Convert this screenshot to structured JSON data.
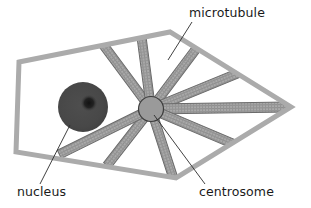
{
  "diagram": {
    "labels": {
      "microtubule": "microtubule",
      "nucleus": "nucleus",
      "centrosome": "centrosome"
    },
    "colors": {
      "background": "#ffffff",
      "membrane_fill": "#a8a8a8",
      "membrane_stroke": "#6e6e6e",
      "cytoplasm": "#ffffff",
      "nucleus_fill": "#4a4a4a",
      "nucleolus_fill": "#1d1d1d",
      "centrosome_fill": "#9a9a9a",
      "centrosome_stroke": "#3c3c3c",
      "microtubule_fill": "#a5a5a5",
      "microtubule_stroke": "#6b6b6b",
      "leader_line": "#2b2b2b",
      "text": "#1a1a1a"
    },
    "shapes": {
      "cell_outline_points": "19,62 170,32 291,107 176,178 16,152",
      "membrane_thickness": 5,
      "nucleus": {
        "cx": 83,
        "cy": 107,
        "r": 25
      },
      "nucleolus": {
        "cx": 89,
        "cy": 103,
        "r": 4
      },
      "centrosome": {
        "cx": 151,
        "cy": 109,
        "r": 12.5
      }
    },
    "microtubules": [
      {
        "name": "microtubule-up-left",
        "x2": 99,
        "y2": 39,
        "width": 9
      },
      {
        "name": "microtubule-up",
        "x2": 141,
        "y2": 33,
        "width": 9
      },
      {
        "name": "microtubule-up-right",
        "x2": 196,
        "y2": 49,
        "width": 9
      },
      {
        "name": "microtubule-right-up",
        "x2": 246,
        "y2": 70,
        "width": 9
      },
      {
        "name": "microtubule-right",
        "x2": 285,
        "y2": 107,
        "width": 10
      },
      {
        "name": "microtubule-right-down",
        "x2": 236,
        "y2": 145,
        "width": 9
      },
      {
        "name": "microtubule-down",
        "x2": 172,
        "y2": 174,
        "width": 9
      },
      {
        "name": "microtubule-down-left",
        "x2": 109,
        "y2": 163,
        "width": 9
      },
      {
        "name": "microtubule-left-down",
        "x2": 62,
        "y2": 153,
        "width": 9
      }
    ],
    "leaders": [
      {
        "name": "leader-microtubule",
        "x1": 192,
        "y1": 22,
        "x2": 168,
        "y2": 60
      },
      {
        "name": "leader-nucleus",
        "x1": 40,
        "y1": 184,
        "x2": 70,
        "y2": 125
      },
      {
        "name": "leader-centrosome",
        "x1": 205,
        "y1": 184,
        "x2": 154,
        "y2": 115
      }
    ]
  }
}
